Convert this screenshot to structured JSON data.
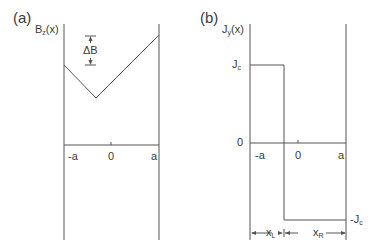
{
  "panel_a": {
    "label": "(a)",
    "ylabel_main": "B",
    "ylabel_sub": "z",
    "ylabel_tail": "(x)",
    "annotation": "ΔB",
    "ticks": [
      "-a",
      "0",
      "a"
    ]
  },
  "panel_b": {
    "label": "(b)",
    "ylabel_main": "J",
    "ylabel_sub": "y",
    "ylabel_tail": "(x)",
    "level_top_main": "J",
    "level_top_sub": "c",
    "zero_label": "0",
    "level_bottom_main": "-J",
    "level_bottom_sub": "c",
    "ticks": [
      "-a",
      "0",
      "a"
    ],
    "dim_left_main": "x",
    "dim_left_sub": "L",
    "dim_right_main": "x",
    "dim_right_sub": "R"
  },
  "colors": {
    "line": "#555555",
    "text": "#3a3a3a"
  }
}
